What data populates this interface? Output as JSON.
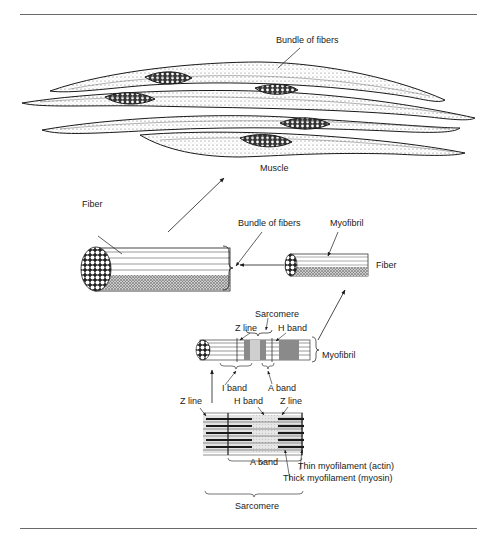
{
  "figure": {
    "labels": {
      "muscle_bundle_of_fibers": "Bundle of fibers",
      "muscle": "Muscle",
      "fiber": "Fiber",
      "bundle_of_fibers": "Bundle of fibers",
      "myofibril_top": "Myofibril",
      "fiber_right": "Fiber",
      "sarcomere_top": "Sarcomere",
      "z_line_top": "Z line",
      "h_band_top": "H band",
      "myofibril_right": "Myofibril",
      "i_band": "I band",
      "a_band_top": "A band",
      "z_line_left": "Z line",
      "h_band_bottom": "H band",
      "z_line_right": "Z line",
      "a_band_bottom": "A band",
      "thin_myofilament": "Thin myofilament (actin)",
      "thick_myofilament": "Thick myofilament (myosin)",
      "sarcomere_bottom": "Sarcomere"
    },
    "colors": {
      "ink": "#1a1a1a",
      "rule": "#6a6a6a",
      "shade": "#9a9a9a",
      "light": "#d8d8d8"
    }
  }
}
